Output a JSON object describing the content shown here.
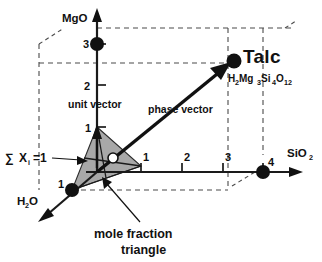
{
  "figure": {
    "name": "ternary-composition-space-diagram",
    "caption": "mole fraction triangle",
    "background_color": "#ffffff",
    "ink_color": "#111111",
    "dashed_color": "#4a4a4a",
    "triangle_fill_color": "#a8a8a8"
  },
  "axes": [
    {
      "id": "mgo",
      "label": "MgO",
      "label_sub": "",
      "direction": "up",
      "ticks": [
        "1",
        "2",
        "3"
      ],
      "marked_value": "3"
    },
    {
      "id": "sio2",
      "label": "SiO",
      "label_sub": "2",
      "direction": "right",
      "ticks": [
        "1",
        "2",
        "3",
        "4"
      ],
      "marked_value": "4"
    },
    {
      "id": "h2o",
      "label": "H",
      "label_sub": "2",
      "label_tail": "O",
      "direction": "down-left",
      "ticks": [
        "1"
      ],
      "marked_value": "1"
    }
  ],
  "annotations": {
    "unit_vector": "unit vector",
    "phase_vector": "phase vector",
    "sum_constraint_sigma": "∑",
    "sum_constraint_x": "X",
    "sum_constraint_sub": "i",
    "sum_constraint_eq": "=1",
    "caption_line1": "mole fraction",
    "caption_line2": "triangle"
  },
  "phase_point": {
    "name": "Talc",
    "formula_parts": [
      {
        "text": "H",
        "sub": "2"
      },
      {
        "text": "Mg",
        "sub": "3"
      },
      {
        "text": "Si",
        "sub": "4"
      },
      {
        "text": "O",
        "sub": "12"
      }
    ],
    "composition": {
      "H2O": 1,
      "MgO": 3,
      "SiO2": 4
    }
  },
  "unit_points": [
    {
      "axis": "MgO",
      "value": "1"
    },
    {
      "axis": "SiO2",
      "value": "1"
    },
    {
      "axis": "H2O",
      "value": "1"
    }
  ]
}
